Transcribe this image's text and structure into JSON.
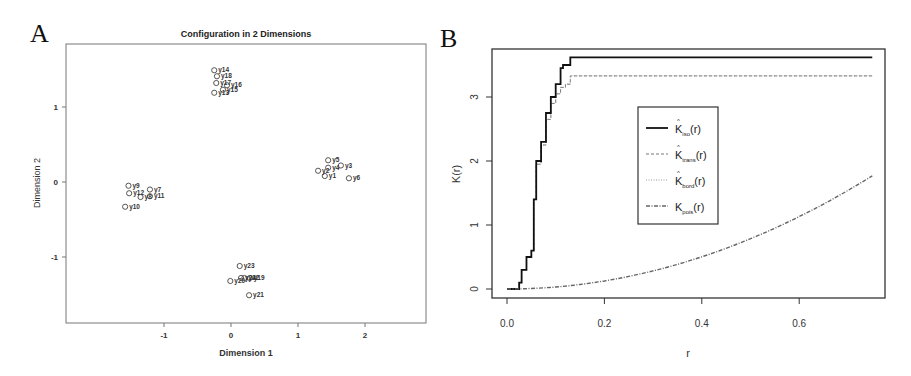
{
  "panels": {
    "a_letter": "A",
    "b_letter": "B"
  },
  "chart_data": [
    {
      "type": "scatter",
      "title": "Configuration in 2 Dimensions",
      "xlabel": "Dimension 1",
      "ylabel": "Dimension 2",
      "xticks": [
        "-1",
        "0",
        "1",
        "2"
      ],
      "yticks": [
        "1",
        "0",
        "-1"
      ],
      "xlim": [
        -2.47,
        2.88
      ],
      "ylim": [
        -1.88,
        1.84
      ],
      "points": [
        {
          "label": "y1",
          "x": 1.4,
          "y": 0.08
        },
        {
          "label": "y2",
          "x": 1.3,
          "y": 0.15
        },
        {
          "label": "y4",
          "x": 1.45,
          "y": 0.19
        },
        {
          "label": "y5",
          "x": 1.45,
          "y": 0.29
        },
        {
          "label": "y3",
          "x": 1.64,
          "y": 0.22
        },
        {
          "label": "y6",
          "x": 1.76,
          "y": 0.05
        },
        {
          "label": "y7",
          "x": -1.21,
          "y": -0.1
        },
        {
          "label": "y8",
          "x": -1.35,
          "y": -0.2
        },
        {
          "label": "y9",
          "x": -1.53,
          "y": -0.05
        },
        {
          "label": "y10",
          "x": -1.58,
          "y": -0.33
        },
        {
          "label": "y11",
          "x": -1.21,
          "y": -0.19
        },
        {
          "label": "y12",
          "x": -1.52,
          "y": -0.15
        },
        {
          "label": "y13",
          "x": -0.25,
          "y": 1.19
        },
        {
          "label": "y14",
          "x": -0.25,
          "y": 1.49
        },
        {
          "label": "y15",
          "x": -0.12,
          "y": 1.23
        },
        {
          "label": "y16",
          "x": -0.06,
          "y": 1.29
        },
        {
          "label": "y17",
          "x": -0.22,
          "y": 1.32
        },
        {
          "label": "y18",
          "x": -0.21,
          "y": 1.41
        },
        {
          "label": "y19",
          "x": 0.28,
          "y": -1.28
        },
        {
          "label": "y20",
          "x": -0.01,
          "y": -1.32
        },
        {
          "label": "y21",
          "x": 0.27,
          "y": -1.51
        },
        {
          "label": "y22",
          "x": 0.2,
          "y": -1.28
        },
        {
          "label": "y23",
          "x": 0.13,
          "y": -1.12
        },
        {
          "label": "y24",
          "x": 0.15,
          "y": -1.28
        }
      ]
    },
    {
      "type": "line",
      "title": "",
      "xlabel": "r",
      "ylabel": "K(r)",
      "xticks": [
        "0.0",
        "0.2",
        "0.4",
        "0.6"
      ],
      "yticks": [
        "0",
        "1",
        "2",
        "3"
      ],
      "xlim": [
        -0.03,
        0.78
      ],
      "ylim": [
        -0.14,
        3.75
      ],
      "legend_position": "center",
      "series": [
        {
          "name": "K̂iso(r)",
          "style": "solid",
          "x": [
            0.0,
            0.022,
            0.025,
            0.03,
            0.04,
            0.05,
            0.055,
            0.06,
            0.07,
            0.08,
            0.09,
            0.1,
            0.11,
            0.115,
            0.12,
            0.13,
            0.75
          ],
          "y": [
            0.0,
            0.0,
            0.1,
            0.3,
            0.5,
            0.6,
            1.4,
            2.0,
            2.3,
            2.75,
            3.0,
            3.2,
            3.45,
            3.5,
            3.5,
            3.62,
            3.62
          ]
        },
        {
          "name": "K̂trans(r)",
          "style": "dashed",
          "x": [
            0.0,
            0.022,
            0.025,
            0.03,
            0.04,
            0.05,
            0.055,
            0.06,
            0.07,
            0.08,
            0.09,
            0.1,
            0.11,
            0.12,
            0.13,
            0.75
          ],
          "y": [
            0.0,
            0.0,
            0.1,
            0.3,
            0.5,
            0.6,
            1.4,
            1.95,
            2.25,
            2.65,
            2.9,
            3.05,
            3.15,
            3.2,
            3.33,
            3.33
          ]
        },
        {
          "name": "K̂bord(r)",
          "style": "dotted",
          "x": [
            0.0,
            0.022,
            0.025,
            0.03,
            0.04,
            0.05,
            0.055,
            0.06,
            0.07,
            0.08,
            0.09,
            0.1,
            0.11,
            0.12,
            0.13,
            0.75
          ],
          "y": [
            0.0,
            0.0,
            0.1,
            0.3,
            0.5,
            0.6,
            1.4,
            1.95,
            2.25,
            2.65,
            2.9,
            3.05,
            3.15,
            3.2,
            3.33,
            3.33
          ]
        },
        {
          "name": "Kpois(r)",
          "style": "dash-dot",
          "x": [
            0.0,
            0.1,
            0.2,
            0.3,
            0.4,
            0.5,
            0.6,
            0.7,
            0.75
          ],
          "y": [
            0.0,
            0.031,
            0.126,
            0.283,
            0.503,
            0.785,
            1.131,
            1.539,
            1.767
          ]
        }
      ]
    }
  ],
  "legend": {
    "items": [
      {
        "main": "K",
        "sub": "iso",
        "tail": "(r)",
        "hat": true
      },
      {
        "main": "K",
        "sub": "trans",
        "tail": "(r)",
        "hat": true
      },
      {
        "main": "K",
        "sub": "bord",
        "tail": "(r)",
        "hat": true
      },
      {
        "main": "K",
        "sub": "pois",
        "tail": "(r)",
        "hat": false
      }
    ]
  }
}
